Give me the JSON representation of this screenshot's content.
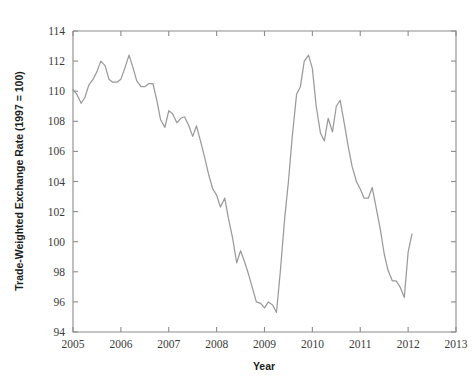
{
  "figure": {
    "background_color": "#ffffff",
    "plot_background_color": "#ffffff",
    "axis_color": "#8c8c8c",
    "line_color": "#9a9a9a"
  },
  "chart_data": {
    "type": "line",
    "title": "",
    "subtitle": "",
    "xlabel": "Year",
    "ylabel": "Trade-Weighted Exchange Rate (1997 = 100)",
    "xlim": [
      2005,
      2013
    ],
    "ylim": [
      94,
      114
    ],
    "xticks": [
      2005,
      2006,
      2007,
      2008,
      2009,
      2010,
      2011,
      2012,
      2013
    ],
    "xtick_labels": [
      "2005",
      "2006",
      "2007",
      "2008",
      "2009",
      "2010",
      "2011",
      "2012",
      "2013"
    ],
    "yticks": [
      94,
      96,
      98,
      100,
      102,
      104,
      106,
      108,
      110,
      112,
      114
    ],
    "ytick_labels": [
      "94",
      "96",
      "98",
      "100",
      "102",
      "104",
      "106",
      "108",
      "110",
      "112",
      "114"
    ],
    "grid": false,
    "legend": false,
    "legend_position": "none",
    "series": [
      {
        "name": "Trade-Weighted Exchange Rate",
        "color": "#9a9a9a",
        "x": [
          2005.0,
          2005.08,
          2005.17,
          2005.25,
          2005.33,
          2005.42,
          2005.5,
          2005.58,
          2005.67,
          2005.75,
          2005.83,
          2005.92,
          2006.0,
          2006.08,
          2006.17,
          2006.25,
          2006.33,
          2006.42,
          2006.5,
          2006.58,
          2006.67,
          2006.75,
          2006.83,
          2006.92,
          2007.0,
          2007.08,
          2007.17,
          2007.25,
          2007.33,
          2007.42,
          2007.5,
          2007.58,
          2007.67,
          2007.75,
          2007.83,
          2007.92,
          2008.0,
          2008.08,
          2008.17,
          2008.25,
          2008.33,
          2008.42,
          2008.5,
          2008.58,
          2008.67,
          2008.75,
          2008.83,
          2008.92,
          2009.0,
          2009.08,
          2009.17,
          2009.25,
          2009.33,
          2009.42,
          2009.5,
          2009.58,
          2009.67,
          2009.75,
          2009.83,
          2009.92,
          2010.0,
          2010.08,
          2010.17,
          2010.25,
          2010.33,
          2010.42,
          2010.5,
          2010.58,
          2010.67,
          2010.75,
          2010.83,
          2010.92,
          2011.0,
          2011.08,
          2011.17,
          2011.25,
          2011.33,
          2011.42,
          2011.5,
          2011.58,
          2011.67,
          2011.75,
          2011.83,
          2011.92,
          2012.0,
          2012.08
        ],
        "y": [
          110.1,
          109.8,
          109.2,
          109.6,
          110.4,
          110.8,
          111.3,
          112.0,
          111.7,
          110.8,
          110.6,
          110.6,
          110.8,
          111.5,
          112.4,
          111.6,
          110.7,
          110.3,
          110.3,
          110.5,
          110.5,
          109.4,
          108.1,
          107.6,
          108.7,
          108.5,
          107.9,
          108.2,
          108.3,
          107.7,
          107.0,
          107.7,
          106.6,
          105.6,
          104.5,
          103.5,
          103.1,
          102.3,
          102.9,
          101.5,
          100.3,
          98.6,
          99.4,
          98.7,
          97.8,
          96.9,
          96.0,
          95.9,
          95.6,
          96.0,
          95.8,
          95.3,
          98.0,
          101.5,
          104.0,
          107.0,
          109.8,
          110.3,
          112.0,
          112.4,
          111.5,
          109.0,
          107.2,
          106.7,
          108.2,
          107.3,
          109.0,
          109.4,
          107.8,
          106.3,
          105.0,
          104.0,
          103.5,
          102.9,
          102.9,
          103.6,
          102.3,
          100.8,
          99.2,
          98.1,
          97.4,
          97.4,
          97.0,
          96.3,
          99.3,
          100.5
        ]
      }
    ],
    "notes": {
      "series_shape": "Declines from ~110 in 2005 with peaks near 112.4 (early 2006) and 112.4 (late 2009); deep trough ~95.3 in late 2008 and ~96.3 in late 2011; ends ~98 in early 2012."
    }
  }
}
